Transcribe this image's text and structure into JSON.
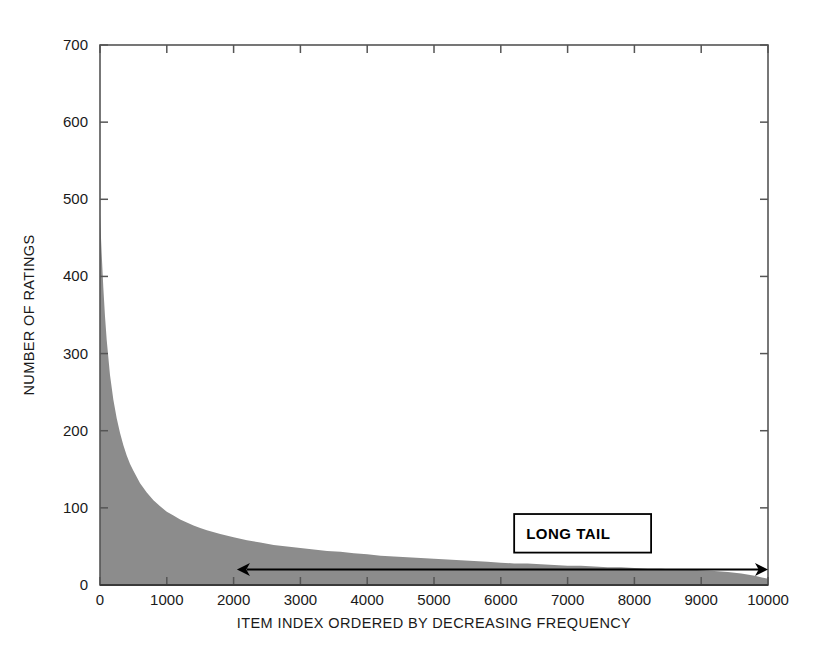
{
  "chart_data": {
    "type": "area",
    "title": "",
    "xlabel": "ITEM INDEX ORDERED BY DECREASING FREQUENCY",
    "ylabel": "NUMBER OF RATINGS",
    "xlim": [
      0,
      10000
    ],
    "ylim": [
      0,
      700
    ],
    "xticks": [
      0,
      1000,
      2000,
      3000,
      4000,
      5000,
      6000,
      7000,
      8000,
      9000,
      10000
    ],
    "yticks": [
      0,
      100,
      200,
      300,
      400,
      500,
      600,
      700
    ],
    "xtick_labels": [
      "0",
      "1000",
      "2000",
      "3000",
      "4000",
      "5000",
      "6000",
      "7000",
      "8000",
      "9000",
      "10000"
    ],
    "ytick_labels": [
      "0",
      "100",
      "200",
      "300",
      "400",
      "500",
      "600",
      "700"
    ],
    "grid": false,
    "legend": "none",
    "fill_color": "#8c8c8c",
    "frame_color": "#555555",
    "x": [
      0,
      25,
      50,
      75,
      100,
      150,
      200,
      250,
      300,
      350,
      400,
      450,
      500,
      600,
      700,
      800,
      900,
      1000,
      1100,
      1200,
      1300,
      1400,
      1500,
      1600,
      1800,
      2000,
      2200,
      2400,
      2600,
      2800,
      3000,
      3200,
      3400,
      3600,
      3800,
      4000,
      4200,
      4400,
      4600,
      4800,
      5000,
      5200,
      5400,
      5600,
      5800,
      6000,
      6200,
      6400,
      6600,
      6800,
      7000,
      7200,
      7400,
      7600,
      7800,
      8000,
      8200,
      8400,
      8600,
      8800,
      9000,
      9200,
      9400,
      9600,
      9800,
      10000
    ],
    "values": [
      480,
      430,
      385,
      348,
      318,
      272,
      240,
      216,
      197,
      181,
      168,
      157,
      148,
      132,
      120,
      110,
      102,
      95,
      90,
      85,
      81,
      77,
      74,
      71,
      66,
      62,
      58,
      55,
      52,
      50,
      48,
      46,
      44,
      43,
      41,
      40,
      38,
      37,
      36,
      35,
      34,
      33,
      32,
      31,
      30,
      29,
      28,
      28,
      27,
      26,
      25,
      25,
      24,
      23,
      23,
      22,
      21,
      21,
      20,
      20,
      19,
      18,
      17,
      15,
      12,
      8
    ],
    "annotations": [
      {
        "id": "long-tail",
        "text": "LONG TAIL",
        "box_x_data": [
          6200,
          8250
        ],
        "box_y_data": [
          42,
          92
        ],
        "arrow_from_data": 2050,
        "arrow_to_data": 10000,
        "arrow_y_data": 20,
        "double_headed": true
      }
    ]
  },
  "annotation": {
    "long_tail_label": "LONG TAIL"
  }
}
